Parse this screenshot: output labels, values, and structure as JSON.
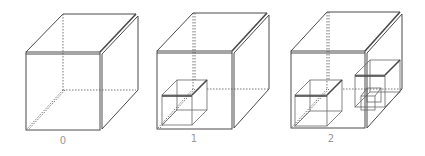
{
  "figure": {
    "panels": [
      {
        "label": "0",
        "inner_cubes": 0
      },
      {
        "label": "1",
        "inner_cubes": 1
      },
      {
        "label": "2",
        "inner_cubes": 2
      }
    ],
    "colors": {
      "line": "#4a4a4a",
      "label": "#999999",
      "background": "#ffffff"
    }
  }
}
